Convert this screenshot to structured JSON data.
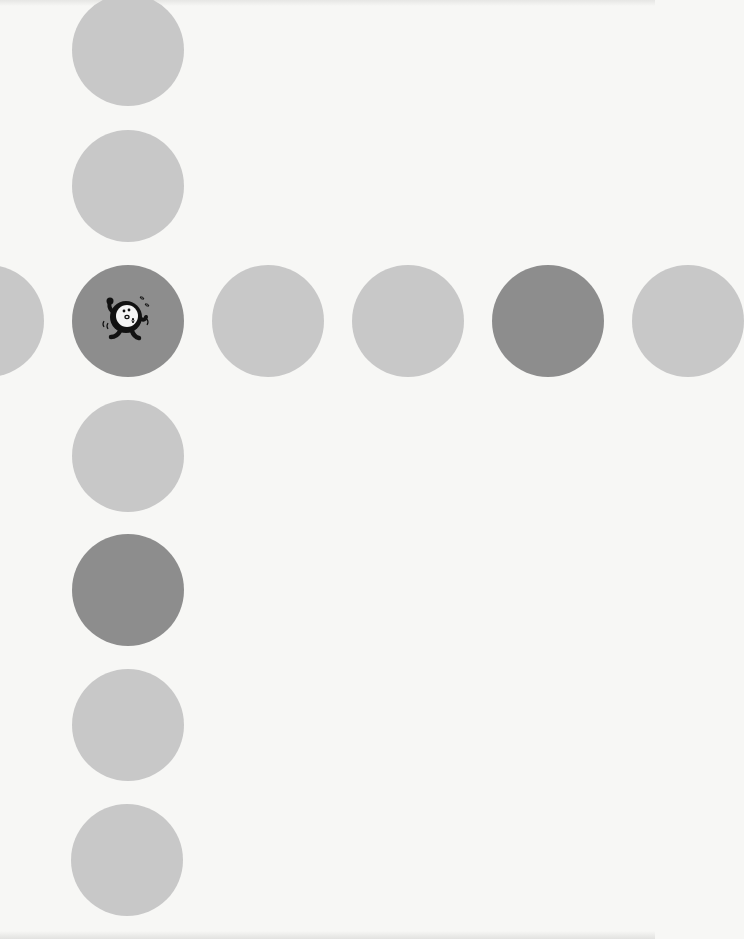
{
  "board": {
    "colors": {
      "light": "#c8c8c8",
      "dark": "#8d8d8d",
      "paper": "#f7f7f5"
    },
    "circle_radius": 56,
    "vertical_column": [
      {
        "id": "v1",
        "cx": 128,
        "cy": 50,
        "shade": "light"
      },
      {
        "id": "v2",
        "cx": 128,
        "cy": 186,
        "shade": "light"
      },
      {
        "id": "v3",
        "cx": 128,
        "cy": 321,
        "shade": "dark",
        "has_character": true
      },
      {
        "id": "v4",
        "cx": 128,
        "cy": 456,
        "shade": "light"
      },
      {
        "id": "v5",
        "cx": 128,
        "cy": 590,
        "shade": "dark"
      },
      {
        "id": "v6",
        "cx": 128,
        "cy": 725,
        "shade": "light"
      },
      {
        "id": "v7",
        "cx": 128,
        "cy": 860,
        "shade": "light"
      }
    ],
    "horizontal_row": [
      {
        "id": "h0",
        "cx": -12,
        "cy": 321,
        "shade": "light",
        "partial": true
      },
      {
        "id": "h2",
        "cx": 268,
        "cy": 321,
        "shade": "light"
      },
      {
        "id": "h3",
        "cx": 408,
        "cy": 321,
        "shade": "light"
      },
      {
        "id": "h4",
        "cx": 548,
        "cy": 321,
        "shade": "dark"
      },
      {
        "id": "h5",
        "cx": 688,
        "cy": 321,
        "shade": "light",
        "partial": true
      }
    ],
    "character": {
      "icon": "running-ball-character-icon",
      "on": "v3"
    }
  }
}
